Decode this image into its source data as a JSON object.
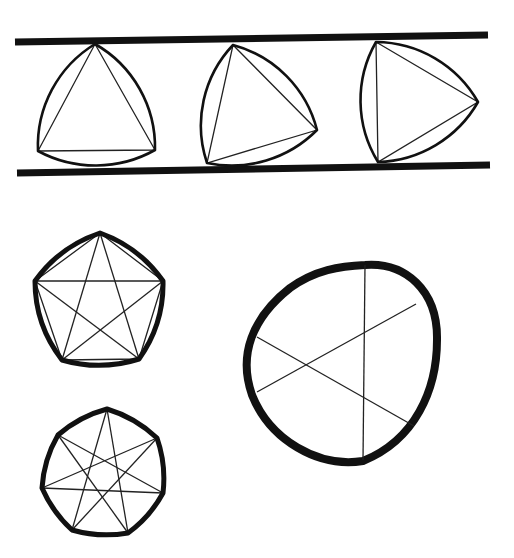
{
  "figure": {
    "stroke_color": "#111111",
    "background": "#ffffff"
  },
  "rails": [
    {
      "name": "top-rail",
      "x1": 15,
      "y1": 42,
      "x2": 488,
      "y2": 35
    },
    {
      "name": "bottom-rail",
      "x1": 17,
      "y1": 173,
      "x2": 490,
      "y2": 165
    }
  ],
  "reuleaux_triangles": [
    {
      "name": "triangle-1",
      "vertices": [
        [
          95,
          44
        ],
        [
          155,
          150
        ],
        [
          38,
          151
        ]
      ]
    },
    {
      "name": "triangle-2",
      "vertices": [
        [
          233,
          45
        ],
        [
          317,
          130
        ],
        [
          207,
          163
        ]
      ]
    },
    {
      "name": "triangle-3",
      "vertices": [
        [
          376,
          42
        ],
        [
          478,
          102
        ],
        [
          378,
          162
        ]
      ]
    }
  ],
  "reuleaux_pentagon": {
    "vertices": [
      [
        100,
        233
      ],
      [
        163,
        281
      ],
      [
        139,
        359
      ],
      [
        62,
        360
      ],
      [
        35,
        281
      ]
    ]
  },
  "reuleaux_heptagon": {
    "vertices": [
      [
        107,
        409
      ],
      [
        157,
        438
      ],
      [
        163,
        493
      ],
      [
        128,
        533
      ],
      [
        72,
        530
      ],
      [
        42,
        488
      ],
      [
        58,
        435
      ]
    ]
  },
  "constant_width_curve": {
    "chords": [
      [
        [
          365,
          265
        ],
        [
          363,
          460
        ]
      ],
      [
        [
          257,
          337
        ],
        [
          414,
          426
        ]
      ],
      [
        [
          257,
          392
        ],
        [
          416,
          304
        ]
      ]
    ]
  }
}
